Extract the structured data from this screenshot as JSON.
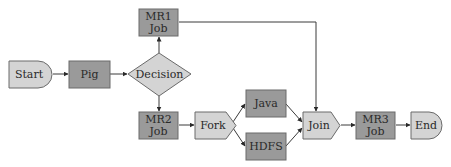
{
  "diagram": {
    "type": "workflow-flowchart",
    "colors": {
      "dark_node_fill": "#9a9a9a",
      "light_node_fill": "#d4d4d4",
      "stroke": "#6a6a6a",
      "edge": "#3a3a3a",
      "text": "#2a2a2a"
    },
    "nodes": {
      "start": {
        "label": "Start"
      },
      "pig": {
        "label": "Pig"
      },
      "decision": {
        "label": "Decision"
      },
      "mr1": {
        "line1": "MR1",
        "line2": "Job"
      },
      "mr2": {
        "line1": "MR2",
        "line2": "Job"
      },
      "fork": {
        "label": "Fork"
      },
      "java": {
        "label": "Java"
      },
      "hdfs": {
        "label": "HDFS"
      },
      "join": {
        "label": "Join"
      },
      "mr3": {
        "line1": "MR3",
        "line2": "Job"
      },
      "end": {
        "label": "End"
      }
    },
    "edges": [
      [
        "Start",
        "Pig"
      ],
      [
        "Pig",
        "Decision"
      ],
      [
        "Decision",
        "MR1 Job"
      ],
      [
        "Decision",
        "MR2 Job"
      ],
      [
        "MR2 Job",
        "Fork"
      ],
      [
        "Fork",
        "Java"
      ],
      [
        "Fork",
        "HDFS"
      ],
      [
        "Java",
        "Join"
      ],
      [
        "HDFS",
        "Join"
      ],
      [
        "MR1 Job",
        "Join"
      ],
      [
        "Join",
        "MR3 Job"
      ],
      [
        "MR3 Job",
        "End"
      ]
    ]
  }
}
